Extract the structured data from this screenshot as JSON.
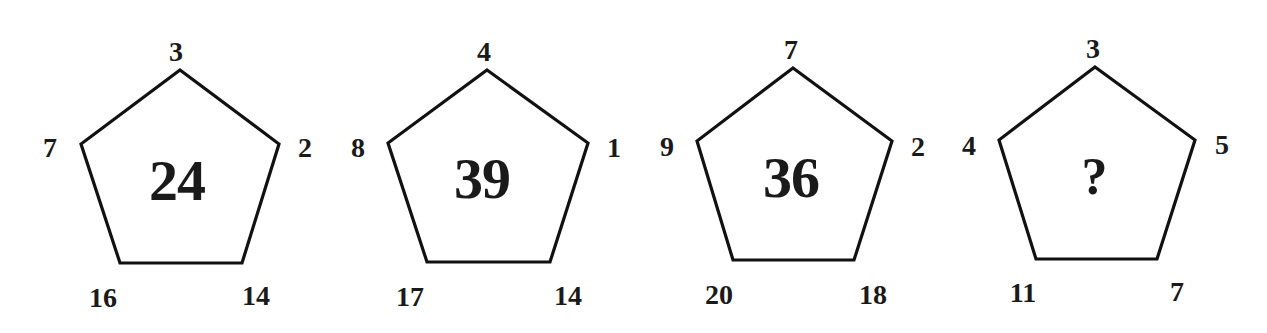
{
  "puzzle": {
    "pentagons": [
      {
        "center": "24",
        "top": "3",
        "right": "2",
        "bottom_right": "14",
        "bottom_left": "16",
        "left": "7",
        "pts": [
          [
            180,
            70
          ],
          [
            279,
            144
          ],
          [
            242,
            263
          ],
          [
            120,
            263
          ],
          [
            81,
            144
          ]
        ],
        "label_pos": {
          "top": [
            176,
            52
          ],
          "right": [
            305,
            148
          ],
          "bottom_right": [
            256,
            296
          ],
          "bottom_left": [
            103,
            298
          ],
          "left": [
            50,
            148
          ]
        },
        "center_pos": [
          177,
          181
        ]
      },
      {
        "center": "39",
        "top": "4",
        "right": "1",
        "bottom_right": "14",
        "bottom_left": "17",
        "left": "8",
        "pts": [
          [
            487,
            70
          ],
          [
            588,
            143
          ],
          [
            550,
            262
          ],
          [
            427,
            262
          ],
          [
            388,
            143
          ]
        ],
        "label_pos": {
          "top": [
            484,
            52
          ],
          "right": [
            614,
            148
          ],
          "bottom_right": [
            568,
            296
          ],
          "bottom_left": [
            410,
            297
          ],
          "left": [
            358,
            148
          ]
        },
        "center_pos": [
          482,
          179
        ]
      },
      {
        "center": "36",
        "top": "7",
        "right": "2",
        "bottom_right": "18",
        "bottom_left": "20",
        "left": "9",
        "pts": [
          [
            793,
            68
          ],
          [
            892,
            141
          ],
          [
            854,
            260
          ],
          [
            733,
            260
          ],
          [
            697,
            141
          ]
        ],
        "label_pos": {
          "top": [
            791,
            50
          ],
          "right": [
            918,
            147
          ],
          "bottom_right": [
            873,
            295
          ],
          "bottom_left": [
            719,
            295
          ],
          "left": [
            667,
            147
          ]
        },
        "center_pos": [
          791,
          178
        ]
      },
      {
        "center": "?",
        "top": "3",
        "right": "5",
        "bottom_right": "7",
        "bottom_left": "11",
        "left": "4",
        "pts": [
          [
            1095,
            67
          ],
          [
            1195,
            140
          ],
          [
            1157,
            259
          ],
          [
            1036,
            259
          ],
          [
            999,
            140
          ]
        ],
        "label_pos": {
          "top": [
            1093,
            49
          ],
          "right": [
            1222,
            145
          ],
          "bottom_right": [
            1177,
            292
          ],
          "bottom_left": [
            1023,
            293
          ],
          "left": [
            969,
            146
          ]
        },
        "center_pos": [
          1094,
          177
        ]
      }
    ],
    "colors": {
      "stroke": "#111111",
      "text": "#1a1a1a",
      "background": "#ffffff"
    }
  }
}
